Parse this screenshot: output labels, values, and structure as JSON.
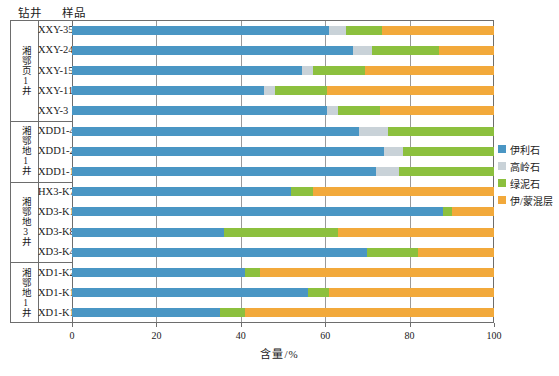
{
  "header": {
    "well_column": "钻井",
    "sample_column": "样品"
  },
  "axis": {
    "x_title": "含量/%",
    "x_ticks": [
      "0",
      "20",
      "40",
      "60",
      "80",
      "100"
    ],
    "x_min": 0,
    "x_max": 100
  },
  "legend": {
    "items": [
      {
        "label": "伊利石",
        "color": "#4a96c4"
      },
      {
        "label": "高岭石",
        "color": "#c9d2d8"
      },
      {
        "label": "绿泥石",
        "color": "#8cc03e"
      },
      {
        "label": "伊/蒙混层",
        "color": "#f2a93b"
      }
    ]
  },
  "groups": [
    {
      "label": "湘鄂页1井",
      "samples": [
        "XXY-35",
        "XXY-24",
        "XXY-15",
        "XXY-11",
        "XXY-3"
      ]
    },
    {
      "label": "湘鄂地1井",
      "samples": [
        "XDD1-41",
        "XDD1-24",
        "XDD1-17"
      ]
    },
    {
      "label": "湘鄂地3井",
      "samples": [
        "HX3-K7",
        "XD3-K16",
        "XD3-K8",
        "XD3-K4"
      ]
    },
    {
      "label": "湘鄂地1井",
      "samples": [
        "XD1-K25",
        "XD1-K13",
        "XD1-K10"
      ]
    }
  ],
  "chart_data": {
    "type": "bar",
    "orientation": "horizontal",
    "stacked": true,
    "title": "",
    "xlabel": "含量/%",
    "ylabel": "",
    "xlim": [
      0,
      100
    ],
    "grid": true,
    "legend_position": "right",
    "categories": [
      "XXY-35",
      "XXY-24",
      "XXY-15",
      "XXY-11",
      "XXY-3",
      "XDD1-41",
      "XDD1-24",
      "XDD1-17",
      "HX3-K7",
      "XD3-K16",
      "XD3-K8",
      "XD3-K4",
      "XD1-K25",
      "XD1-K13",
      "XD1-K10"
    ],
    "series": [
      {
        "name": "伊利石",
        "color": "#4a96c4",
        "values": [
          61,
          66.5,
          54.5,
          45.5,
          60.5,
          68,
          74,
          72,
          52,
          88,
          36,
          70,
          41,
          56,
          35
        ]
      },
      {
        "name": "高岭石",
        "color": "#c9d2d8",
        "values": [
          4,
          4.5,
          2.5,
          2.5,
          2.5,
          7,
          4.5,
          5.5,
          0,
          0,
          0,
          0,
          0,
          0,
          0
        ]
      },
      {
        "name": "绿泥石",
        "color": "#8cc03e",
        "values": [
          8.5,
          16,
          12.5,
          12.5,
          10,
          25,
          21.5,
          22.5,
          5,
          2,
          27,
          12,
          3.5,
          5,
          6
        ]
      },
      {
        "name": "伊/蒙混层",
        "color": "#f2a93b",
        "values": [
          26.5,
          13,
          30.5,
          39.5,
          27,
          0,
          0,
          0,
          43,
          10,
          37,
          18,
          55.5,
          39,
          59
        ]
      }
    ]
  }
}
